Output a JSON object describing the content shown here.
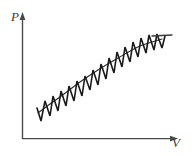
{
  "figure": {
    "type": "pv-diagram",
    "title": "",
    "background_color": "#ffffff",
    "width": 194,
    "height": 156
  },
  "axes": {
    "vertical": {
      "label": "P",
      "name": "pressure-axis",
      "color": "#4a4a4a",
      "x": 22,
      "y_top": 16,
      "y_bottom": 139,
      "arrow": "up"
    },
    "horizontal": {
      "label": "V",
      "name": "volume-axis",
      "color": "#4a4a4a",
      "y": 139,
      "x_left": 22,
      "x_right": 178,
      "arrow": "right"
    }
  },
  "chart_data": {
    "type": "line",
    "title": "",
    "xlabel": "V",
    "ylabel": "P",
    "grid": false,
    "legend": null,
    "series": [
      {
        "name": "sawtooth-cycle-path",
        "color": "#1a1a1a",
        "stroke_width": 1.6,
        "description": "Sawtooth / zigzag curve rising from lower-left to upper-right, representing repeated small thermodynamic cycles along an overall expansion.",
        "teeth_count": 14,
        "amplitude": 23,
        "envelope_start": [
          38,
          118
        ],
        "envelope_end": [
          165,
          38
        ],
        "points": [
          [
            37,
            108
          ],
          [
            41,
            121
          ],
          [
            45,
            101
          ],
          [
            45,
            101
          ],
          [
            50,
            116
          ],
          [
            53,
            96
          ],
          [
            53,
            96
          ],
          [
            58,
            111
          ],
          [
            61,
            91
          ],
          [
            61,
            91
          ],
          [
            66,
            106
          ],
          [
            69,
            86
          ],
          [
            69,
            86
          ],
          [
            74,
            101
          ],
          [
            77,
            81
          ],
          [
            77,
            81
          ],
          [
            82,
            96
          ],
          [
            85,
            76
          ],
          [
            85,
            76
          ],
          [
            90,
            90
          ],
          [
            93,
            70
          ],
          [
            93,
            70
          ],
          [
            98,
            85
          ],
          [
            101,
            64
          ],
          [
            101,
            64
          ],
          [
            106,
            79
          ],
          [
            109,
            58
          ],
          [
            109,
            58
          ],
          [
            114,
            73
          ],
          [
            117,
            52
          ],
          [
            117,
            52
          ],
          [
            122,
            67
          ],
          [
            125,
            47
          ],
          [
            125,
            47
          ],
          [
            130,
            62
          ],
          [
            133,
            42
          ],
          [
            133,
            42
          ],
          [
            138,
            57
          ],
          [
            141,
            38
          ],
          [
            141,
            38
          ],
          [
            146,
            53
          ],
          [
            149,
            35
          ],
          [
            149,
            35
          ],
          [
            154,
            50
          ],
          [
            157,
            34
          ],
          [
            157,
            34
          ],
          [
            162,
            48
          ],
          [
            165,
            36
          ]
        ],
        "tail_segment": [
          [
            152,
            36
          ],
          [
            172,
            35
          ]
        ]
      },
      {
        "name": "upper-envelope-trend",
        "color": "#2a2a2a",
        "stroke_width": 1.1,
        "description": "Smooth mean trend line through the zigzag, concave-down rising curve.",
        "points": [
          [
            38,
            113
          ],
          [
            50,
            104
          ],
          [
            64,
            94
          ],
          [
            80,
            82
          ],
          [
            98,
            70
          ],
          [
            118,
            58
          ],
          [
            140,
            46
          ],
          [
            162,
            39
          ]
        ]
      }
    ]
  },
  "icons": {
    "p_axis_arrow": "arrow-up-icon",
    "v_axis_arrow": "arrow-right-icon"
  }
}
